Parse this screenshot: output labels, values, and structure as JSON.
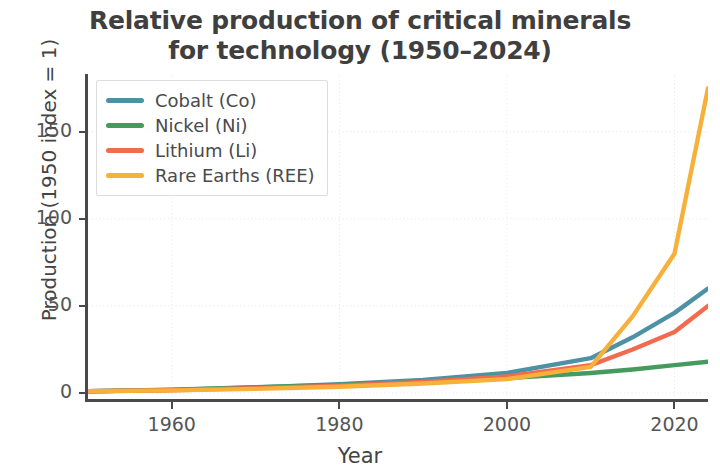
{
  "chart_data": {
    "type": "line",
    "title": "Relative production of critical minerals\nfor technology (1950–2024)",
    "xlabel": "Year",
    "ylabel": "Production (1950 index = 1)",
    "xlim": [
      1950,
      2024
    ],
    "ylim": [
      -4,
      182
    ],
    "grid": true,
    "legend_position": "upper left",
    "x": [
      1950,
      1960,
      1970,
      1980,
      1990,
      2000,
      2010,
      2015,
      2020,
      2024
    ],
    "xticks": [
      1960,
      1980,
      2000,
      2020
    ],
    "xtick_labels": [
      "1960",
      "1980",
      "2000",
      "2020"
    ],
    "yticks": [
      0,
      50,
      100,
      150
    ],
    "ytick_labels": [
      "0",
      "50",
      "100",
      "150"
    ],
    "series": [
      {
        "name": "Cobalt (Co)",
        "color": "#4C92A4",
        "values": [
          1,
          1.8,
          3.2,
          5.0,
          7.5,
          11.5,
          20.0,
          32.0,
          46.0,
          60.0
        ]
      },
      {
        "name": "Nickel (Ni)",
        "color": "#479A5F",
        "values": [
          1,
          1.9,
          3.4,
          4.6,
          6.2,
          8.5,
          11.5,
          13.5,
          16.0,
          18.0
        ]
      },
      {
        "name": "Lithium (Li)",
        "color": "#F26B4E",
        "values": [
          1,
          1.6,
          2.8,
          4.2,
          6.4,
          9.5,
          16.0,
          25.0,
          35.0,
          50.0
        ]
      },
      {
        "name": "Rare Earths (REE)",
        "color": "#F7B03A",
        "values": [
          1,
          1.5,
          2.4,
          3.6,
          5.5,
          8.0,
          15.0,
          44.0,
          80.0,
          175.0
        ]
      }
    ]
  },
  "legend": {
    "entries": [
      {
        "label": "Cobalt (Co)",
        "color": "#4C92A4"
      },
      {
        "label": "Nickel (Ni)",
        "color": "#479A5F"
      },
      {
        "label": "Lithium (Li)",
        "color": "#F26B4E"
      },
      {
        "label": "Rare Earths (REE)",
        "color": "#F7B03A"
      }
    ]
  }
}
